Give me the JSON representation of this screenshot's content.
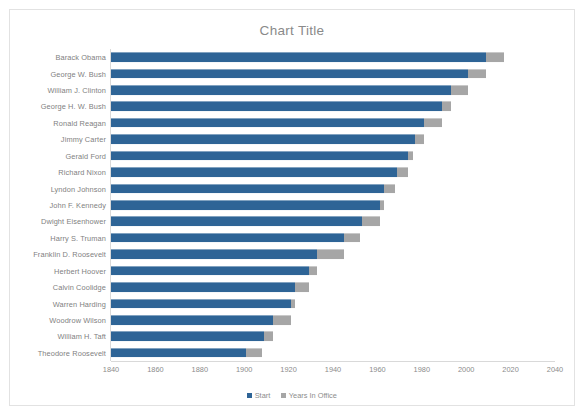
{
  "chart": {
    "title": "Chart Title",
    "legend": [
      {
        "label": "Start",
        "color": "#2e6496"
      },
      {
        "label": "Years In Office",
        "color": "#a6a6a6"
      }
    ]
  },
  "chart_data": {
    "type": "bar",
    "subtype": "stacked-horizontal-bar",
    "title": "Chart Title",
    "subtitle": "",
    "xlabel": "",
    "ylabel": "",
    "xlim": [
      1840,
      2040
    ],
    "ylim": null,
    "xticks": [
      1840,
      1860,
      1880,
      1900,
      1920,
      1940,
      1960,
      1980,
      2000,
      2020,
      2040
    ],
    "grid": false,
    "legend_position": "bottom",
    "orientation": "horizontal",
    "categories": [
      "Barack Obama",
      "George W. Bush",
      "William J. Clinton",
      "George H. W. Bush",
      "Ronald Reagan",
      "Jimmy Carter",
      "Gerald Ford",
      "Richard Nixon",
      "Lyndon Johnson",
      "John F. Kennedy",
      "Dwight Eisenhower",
      "Harry S. Truman",
      "Franklin D. Roosevelt",
      "Herbert Hoover",
      "Calvin Coolidge",
      "Warren Harding",
      "Woodrow Wilson",
      "William H. Taft",
      "Theodore Roosevelt"
    ],
    "series": [
      {
        "name": "Start",
        "color": "#2e6496",
        "values": [
          2009,
          2001,
          1993,
          1989,
          1981,
          1977,
          1974,
          1969,
          1963,
          1961,
          1953,
          1945,
          1933,
          1929,
          1923,
          1921,
          1913,
          1909,
          1901
        ]
      },
      {
        "name": "Years In Office",
        "color": "#a6a6a6",
        "values": [
          8,
          8,
          8,
          4,
          8,
          4,
          2,
          5,
          5,
          2,
          8,
          7,
          12,
          4,
          6,
          2,
          8,
          4,
          7
        ]
      }
    ]
  }
}
